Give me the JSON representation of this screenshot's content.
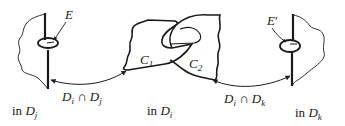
{
  "figure": {
    "stroke_color": "#1a1a1a",
    "background": "#ffffff"
  },
  "panels": [
    {
      "id": "Dj",
      "caption_prefix": "in",
      "caption_var": "D",
      "caption_sub": "j",
      "disk_label": "E",
      "disk_label_prime": ""
    },
    {
      "id": "Di",
      "caption_prefix": "in",
      "caption_var": "D",
      "caption_sub": "i",
      "components": [
        {
          "var": "C",
          "sub": "1"
        },
        {
          "var": "C",
          "sub": "2"
        }
      ]
    },
    {
      "id": "Dk",
      "caption_prefix": "in",
      "caption_var": "D",
      "caption_sub": "k",
      "disk_label": "E",
      "disk_label_prime": "′"
    }
  ],
  "connections": [
    {
      "from": "Dj",
      "to": "Di",
      "type": "double-arrow",
      "label_left_var": "D",
      "label_left_sub": "i",
      "operator": "∩",
      "label_right_var": "D",
      "label_right_sub": "j"
    },
    {
      "from": "Di",
      "to": "Dk",
      "type": "double-arrow",
      "label_left_var": "D",
      "label_left_sub": "i",
      "operator": "∩",
      "label_right_var": "D",
      "label_right_sub": "k"
    }
  ]
}
